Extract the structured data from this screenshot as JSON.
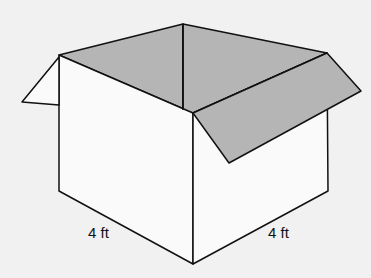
{
  "diagram": {
    "labels": {
      "left_edge": "4 ft",
      "right_edge": "4 ft"
    },
    "colors": {
      "background": "#f1f1f1",
      "face": "#fafafa",
      "interior": "#b5b5b5",
      "stroke": "#111111"
    }
  }
}
